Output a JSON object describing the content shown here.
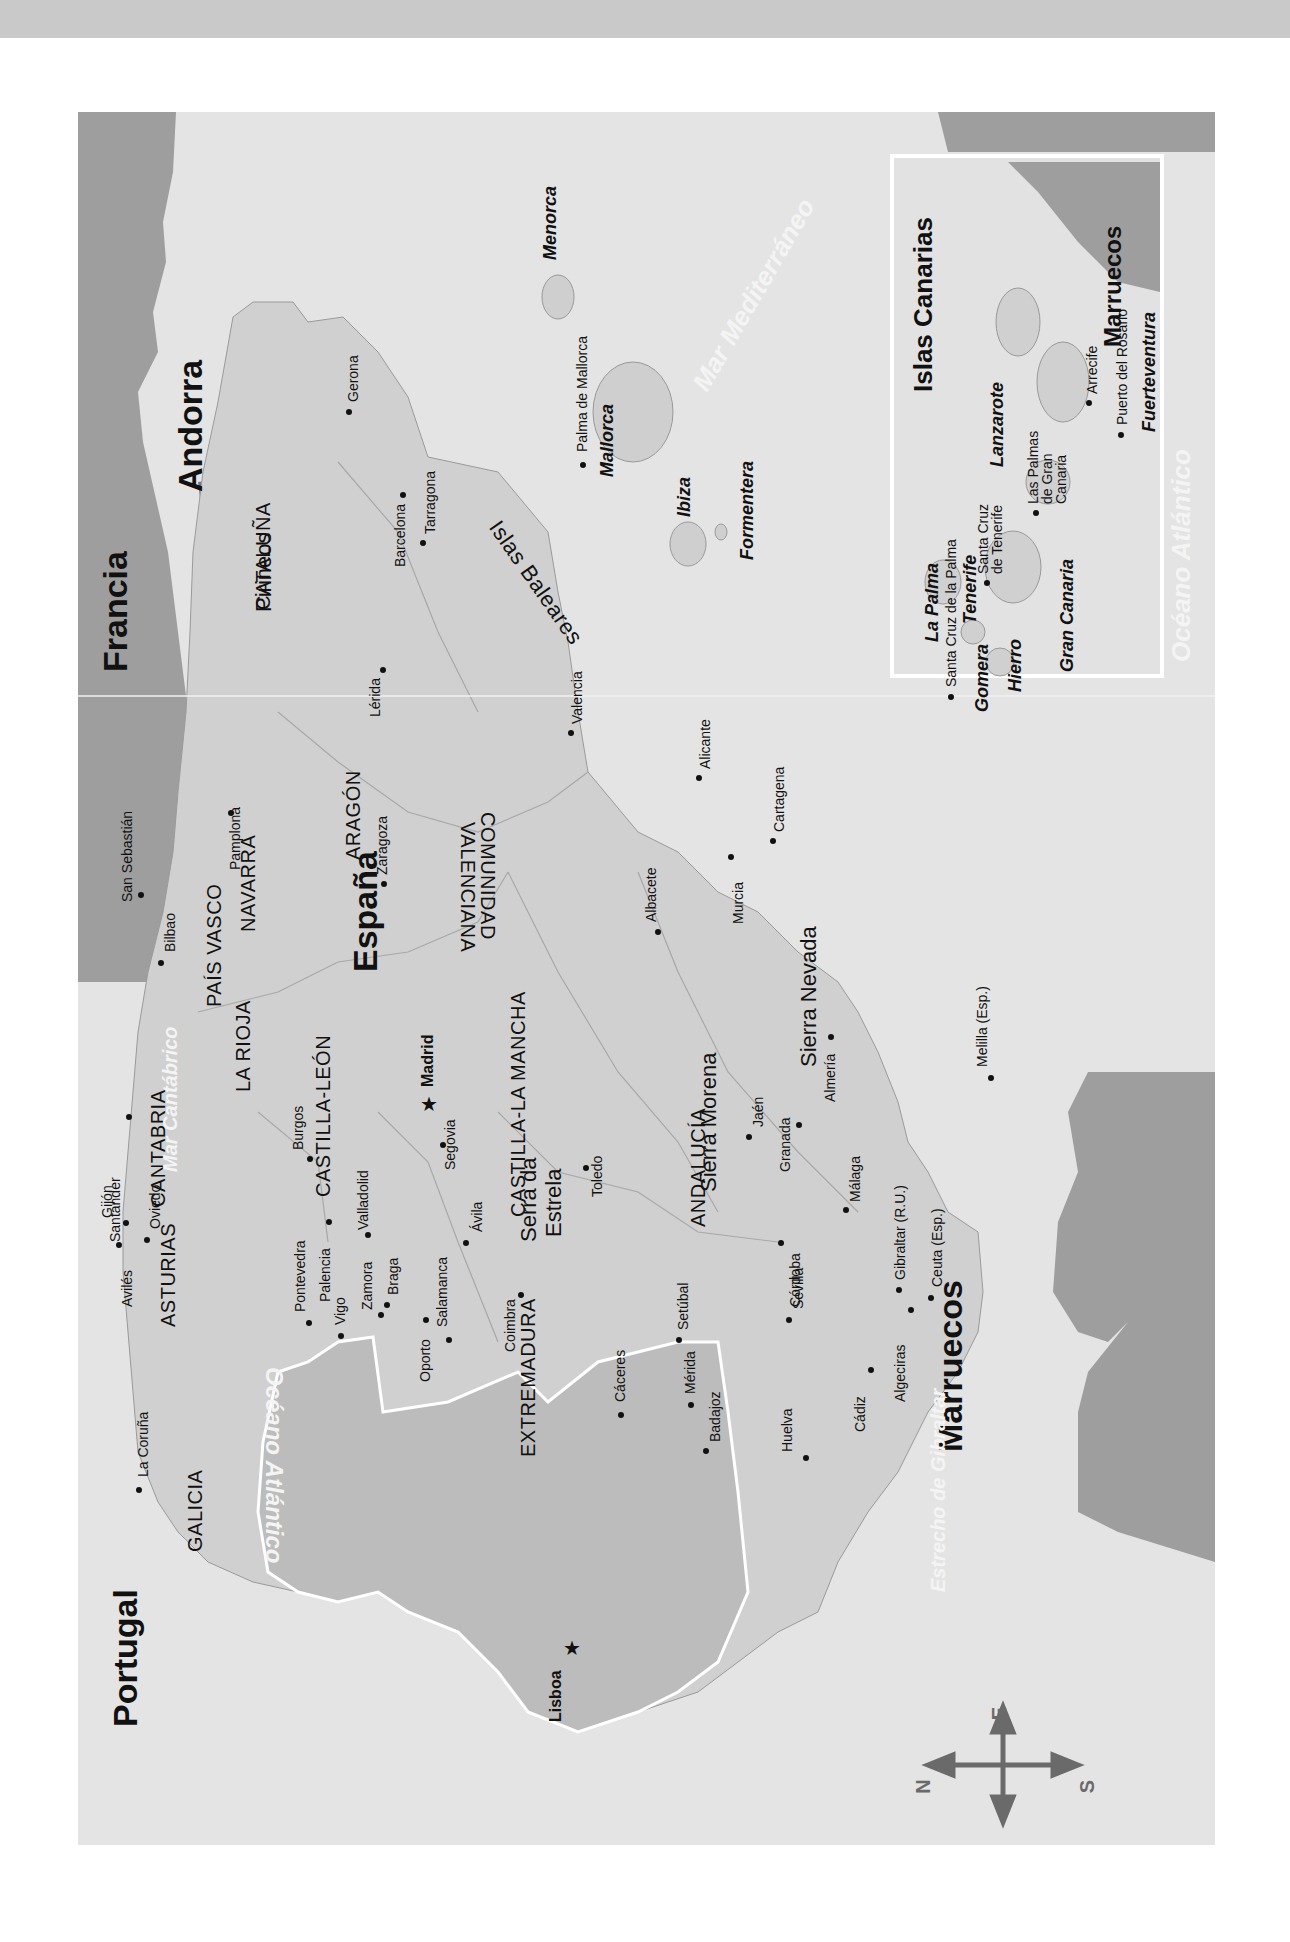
{
  "map": {
    "title": "España y Portugal",
    "orientation": "rotated 90° — north points left",
    "colors": {
      "sea": "#e4e4e4",
      "land_spain": "#d2d2d2",
      "land_portugal": "#bdbdbd",
      "neighbor_country": "#9e9e9e",
      "andorra": "#7a7a7a",
      "border_white": "#ffffff",
      "top_band": "#c9c9c9"
    },
    "countries": {
      "spain": "España",
      "portugal": "Portugal",
      "france": "Francia",
      "andorra": "Andorra",
      "morocco": "Marruecos",
      "morocco_inset": "Marruecos"
    },
    "regions": {
      "galicia": "GALICIA",
      "asturias": "ASTURIAS",
      "cantabria": "CANTABRIA",
      "pais_vasco": "PAÍS VASCO",
      "navarra": "NAVARRA",
      "la_rioja": "LA RIOJA",
      "aragon": "ARAGÓN",
      "cataluna": "CATALUÑA",
      "castilla_leon": "CASTILLA-LEÓN",
      "castilla_la_mancha": "CASTILLA-LA MANCHA",
      "comunidad_valenciana_1": "COMUNIDAD",
      "comunidad_valenciana_2": "VALENCIANA",
      "extremadura": "EXTREMADURA",
      "andalucia": "ANDALUCÍA"
    },
    "capitals": {
      "madrid": "Madrid",
      "lisboa": "Lisboa"
    },
    "cities": {
      "la_coruna": "La Coruña",
      "aviles": "Avilés",
      "gijon": "Gijón",
      "oviedo": "Oviedo",
      "santander": "Santander",
      "bilbao": "Bilbao",
      "san_sebastian": "San Sebastián",
      "pamplona": "Pamplona",
      "burgos": "Burgos",
      "palencia": "Palencia",
      "valladolid": "Valladolid",
      "zamora": "Zamora",
      "salamanca": "Salamanca",
      "avila": "Ávila",
      "segovia": "Segovia",
      "toledo": "Toledo",
      "caceres": "Cáceres",
      "merida": "Mérida",
      "badajoz": "Badajoz",
      "huelva": "Huelva",
      "sevilla": "Sevilla",
      "cordoba": "Córdoba",
      "jaen": "Jaén",
      "granada": "Granada",
      "almeria": "Almería",
      "malaga": "Málaga",
      "cadiz": "Cádiz",
      "algeciras": "Algeciras",
      "gibraltar": "Gibraltar (R.U.)",
      "ceuta": "Ceuta (Esp.)",
      "melilla": "Melilla (Esp.)",
      "murcia": "Murcia",
      "cartagena": "Cartagena",
      "alicante": "Alicante",
      "albacete": "Albacete",
      "valencia": "Valencia",
      "zaragoza": "Zaragoza",
      "lerida": "Lérida",
      "barcelona": "Barcelona",
      "tarragona": "Tarragona",
      "gerona": "Gerona",
      "pontevedra": "Pontevedra",
      "vigo": "Vigo",
      "braga": "Braga",
      "oporto": "Oporto",
      "coimbra": "Coimbra",
      "setubal": "Setúbal",
      "palma_de_mallorca": "Palma de Mallorca"
    },
    "mountains": {
      "pirineos": "Pirineos",
      "sierra_morena": "Sierra Morena",
      "sierra_nevada": "Sierra Nevada",
      "serra_da_estrela_1": "Serra da",
      "serra_da_estrela_2": "Estrela"
    },
    "water": {
      "mar_cantabrico": "Mar Cantábrico",
      "oceano_atlantico": "Océano Atlántico",
      "mar_mediterraneo": "Mar Mediterráneo",
      "estrecho_gibraltar": "Estrecho de Gibraltar",
      "oceano_atlantico_inset": "Océano Atlántico"
    },
    "baleares": {
      "group": "Islas Baleares",
      "mallorca": "Mallorca",
      "menorca": "Menorca",
      "ibiza": "Ibiza",
      "formentera": "Formentera"
    },
    "canarias_inset": {
      "title": "Islas Canarias",
      "islands": {
        "la_palma": "La Palma",
        "tenerife": "Tenerife",
        "gomera": "Gomera",
        "hierro": "Hierro",
        "gran_canaria": "Gran Canaria",
        "lanzarote": "Lanzarote",
        "fuerteventura": "Fuerteventura"
      },
      "cities": {
        "santa_cruz_la_palma": "Santa Cruz de la Palma",
        "santa_cruz_tenerife_1": "Santa Cruz",
        "santa_cruz_tenerife_2": "de Tenerife",
        "las_palmas_1": "Las Palmas",
        "las_palmas_2": "de Gran",
        "las_palmas_3": "Canaria",
        "arrecife": "Arrecife",
        "puerto_del_rosario": "Puerto del Rosario"
      }
    },
    "compass": {
      "north": "N",
      "south": "S",
      "east": "E",
      "west": "O"
    }
  }
}
